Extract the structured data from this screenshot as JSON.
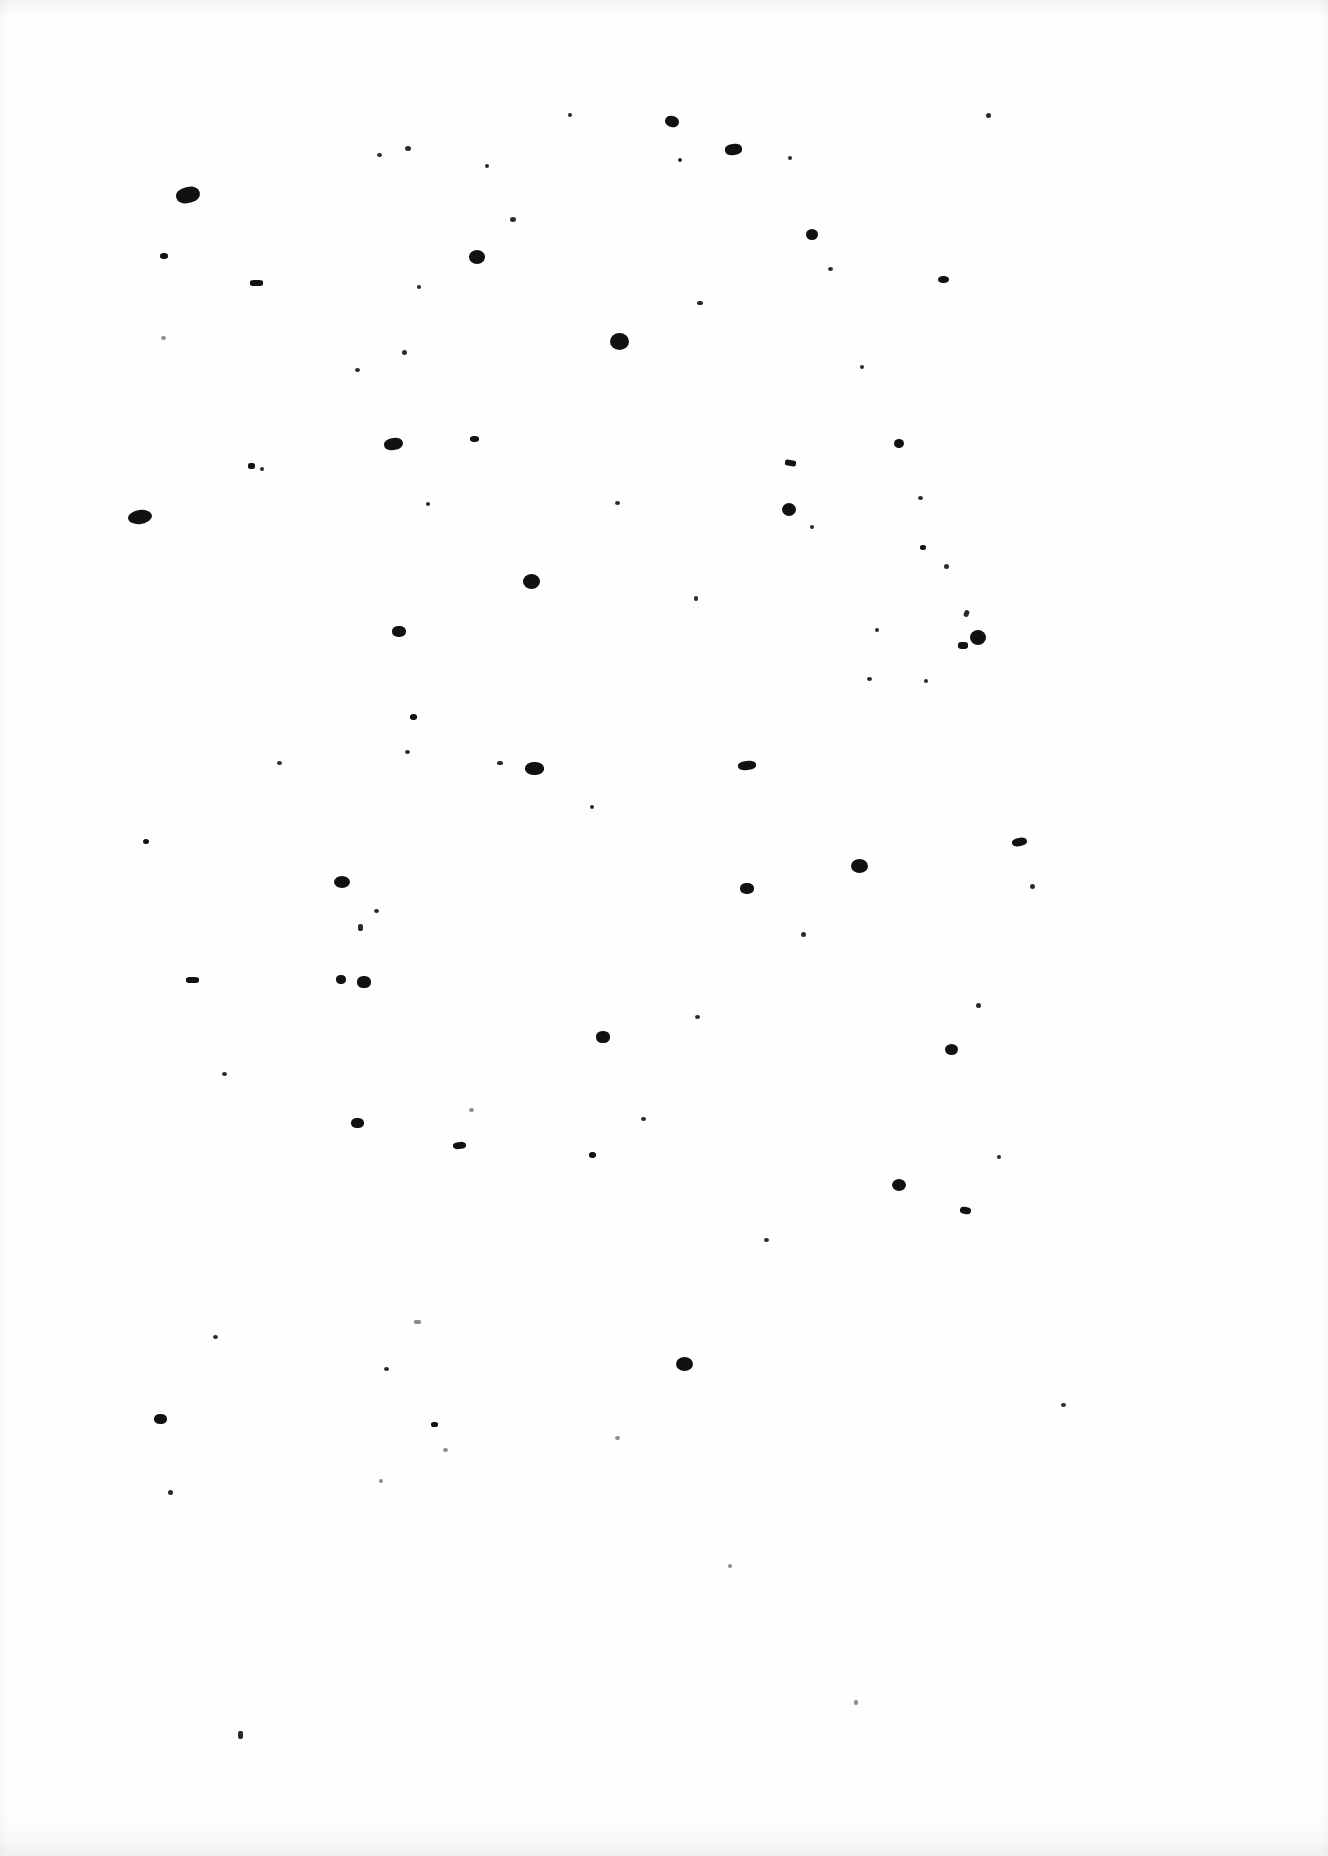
{
  "document": {
    "kind": "scanned-page",
    "title": "Scanned Blank Page",
    "page_width": 1328,
    "page_height": 1856,
    "background_color": "#fefefe",
    "ink_color": "#141414",
    "visible_text": "",
    "has_text": false,
    "description": "Blank scanned sheet of paper bearing only scattered ink specks, dust marks and show-through flecks."
  },
  "scan_artifacts": {
    "edge_shadow_color": "#96969b",
    "top_edge": true,
    "bottom_edge": true,
    "left_edge": true,
    "right_edge": true
  },
  "marks": [
    {
      "x": 988,
      "y": 115,
      "w": 5,
      "h": 5,
      "r": 50,
      "rot": 0,
      "cls": "tiny"
    },
    {
      "x": 672,
      "y": 121,
      "w": 14,
      "h": 11,
      "r": 45,
      "rot": 15,
      "cls": "blob"
    },
    {
      "x": 570,
      "y": 115,
      "w": 4,
      "h": 4,
      "r": 50,
      "rot": 0,
      "cls": "tiny"
    },
    {
      "x": 733,
      "y": 149,
      "w": 17,
      "h": 11,
      "r": 40,
      "rot": -8,
      "cls": "blob"
    },
    {
      "x": 408,
      "y": 148,
      "w": 6,
      "h": 5,
      "r": 50,
      "rot": 0,
      "cls": "tiny"
    },
    {
      "x": 379,
      "y": 155,
      "w": 5,
      "h": 4,
      "r": 50,
      "rot": 0,
      "cls": "tiny"
    },
    {
      "x": 487,
      "y": 166,
      "w": 4,
      "h": 4,
      "r": 50,
      "rot": 0,
      "cls": "tiny"
    },
    {
      "x": 680,
      "y": 160,
      "w": 4,
      "h": 4,
      "r": 50,
      "rot": 0,
      "cls": "tiny"
    },
    {
      "x": 790,
      "y": 158,
      "w": 4,
      "h": 4,
      "r": 50,
      "rot": 0,
      "cls": "tiny"
    },
    {
      "x": 188,
      "y": 195,
      "w": 24,
      "h": 16,
      "r": 45,
      "rot": -12,
      "cls": "blob"
    },
    {
      "x": 513,
      "y": 219,
      "w": 6,
      "h": 5,
      "r": 50,
      "rot": 0,
      "cls": "tiny"
    },
    {
      "x": 812,
      "y": 234,
      "w": 12,
      "h": 11,
      "r": 50,
      "rot": 0,
      "cls": "blob"
    },
    {
      "x": 477,
      "y": 257,
      "w": 16,
      "h": 14,
      "r": 50,
      "rot": 0,
      "cls": "blob"
    },
    {
      "x": 164,
      "y": 256,
      "w": 8,
      "h": 6,
      "r": 45,
      "rot": 0,
      "cls": "blob"
    },
    {
      "x": 830,
      "y": 269,
      "w": 5,
      "h": 4,
      "r": 50,
      "rot": 0,
      "cls": "tiny"
    },
    {
      "x": 943,
      "y": 279,
      "w": 11,
      "h": 7,
      "r": 45,
      "rot": 0,
      "cls": "blob"
    },
    {
      "x": 256,
      "y": 283,
      "w": 13,
      "h": 6,
      "r": 30,
      "rot": 0,
      "cls": "blob"
    },
    {
      "x": 419,
      "y": 287,
      "w": 4,
      "h": 4,
      "r": 50,
      "rot": 0,
      "cls": "tiny"
    },
    {
      "x": 700,
      "y": 303,
      "w": 6,
      "h": 4,
      "r": 40,
      "rot": 0,
      "cls": "tiny"
    },
    {
      "x": 619,
      "y": 341,
      "w": 19,
      "h": 17,
      "r": 50,
      "rot": 0,
      "cls": "blob"
    },
    {
      "x": 163,
      "y": 338,
      "w": 5,
      "h": 4,
      "r": 50,
      "rot": 0,
      "cls": "faint"
    },
    {
      "x": 404,
      "y": 352,
      "w": 5,
      "h": 5,
      "r": 50,
      "rot": 0,
      "cls": "tiny"
    },
    {
      "x": 357,
      "y": 370,
      "w": 5,
      "h": 4,
      "r": 50,
      "rot": 0,
      "cls": "tiny"
    },
    {
      "x": 862,
      "y": 367,
      "w": 4,
      "h": 4,
      "r": 50,
      "rot": 0,
      "cls": "tiny"
    },
    {
      "x": 393,
      "y": 444,
      "w": 19,
      "h": 12,
      "r": 45,
      "rot": -10,
      "cls": "blob"
    },
    {
      "x": 474,
      "y": 439,
      "w": 9,
      "h": 6,
      "r": 45,
      "rot": 0,
      "cls": "blob"
    },
    {
      "x": 899,
      "y": 443,
      "w": 10,
      "h": 9,
      "r": 50,
      "rot": 0,
      "cls": "blob"
    },
    {
      "x": 790,
      "y": 463,
      "w": 11,
      "h": 6,
      "r": 30,
      "rot": 10,
      "cls": "blob"
    },
    {
      "x": 251,
      "y": 466,
      "w": 7,
      "h": 6,
      "r": 35,
      "rot": 0,
      "cls": "blob"
    },
    {
      "x": 262,
      "y": 469,
      "w": 4,
      "h": 4,
      "r": 50,
      "rot": 0,
      "cls": "tiny"
    },
    {
      "x": 428,
      "y": 504,
      "w": 4,
      "h": 4,
      "r": 50,
      "rot": 0,
      "cls": "tiny"
    },
    {
      "x": 140,
      "y": 517,
      "w": 24,
      "h": 14,
      "r": 50,
      "rot": -8,
      "cls": "blob"
    },
    {
      "x": 789,
      "y": 509,
      "w": 14,
      "h": 13,
      "r": 50,
      "rot": 0,
      "cls": "blob"
    },
    {
      "x": 617,
      "y": 503,
      "w": 5,
      "h": 4,
      "r": 50,
      "rot": 0,
      "cls": "tiny"
    },
    {
      "x": 920,
      "y": 498,
      "w": 5,
      "h": 4,
      "r": 50,
      "rot": 0,
      "cls": "tiny"
    },
    {
      "x": 812,
      "y": 527,
      "w": 4,
      "h": 4,
      "r": 50,
      "rot": 0,
      "cls": "tiny"
    },
    {
      "x": 923,
      "y": 547,
      "w": 6,
      "h": 5,
      "r": 45,
      "rot": 0,
      "cls": "blob"
    },
    {
      "x": 946,
      "y": 566,
      "w": 5,
      "h": 5,
      "r": 50,
      "rot": 0,
      "cls": "tiny"
    },
    {
      "x": 531,
      "y": 581,
      "w": 17,
      "h": 15,
      "r": 50,
      "rot": 0,
      "cls": "blob"
    },
    {
      "x": 696,
      "y": 598,
      "w": 4,
      "h": 5,
      "r": 45,
      "rot": 0,
      "cls": "tiny"
    },
    {
      "x": 966,
      "y": 613,
      "w": 5,
      "h": 7,
      "r": 40,
      "rot": 20,
      "cls": "tiny"
    },
    {
      "x": 399,
      "y": 631,
      "w": 14,
      "h": 11,
      "r": 45,
      "rot": 0,
      "cls": "blob"
    },
    {
      "x": 877,
      "y": 630,
      "w": 4,
      "h": 4,
      "r": 50,
      "rot": 0,
      "cls": "tiny"
    },
    {
      "x": 978,
      "y": 637,
      "w": 16,
      "h": 15,
      "r": 50,
      "rot": 0,
      "cls": "blob"
    },
    {
      "x": 963,
      "y": 645,
      "w": 10,
      "h": 7,
      "r": 35,
      "rot": 0,
      "cls": "blob"
    },
    {
      "x": 869,
      "y": 679,
      "w": 5,
      "h": 4,
      "r": 50,
      "rot": 0,
      "cls": "tiny"
    },
    {
      "x": 926,
      "y": 681,
      "w": 4,
      "h": 4,
      "r": 50,
      "rot": 0,
      "cls": "tiny"
    },
    {
      "x": 413,
      "y": 717,
      "w": 7,
      "h": 6,
      "r": 45,
      "rot": 0,
      "cls": "blob"
    },
    {
      "x": 407,
      "y": 752,
      "w": 5,
      "h": 4,
      "r": 50,
      "rot": 0,
      "cls": "tiny"
    },
    {
      "x": 279,
      "y": 763,
      "w": 5,
      "h": 4,
      "r": 50,
      "rot": 0,
      "cls": "tiny"
    },
    {
      "x": 500,
      "y": 763,
      "w": 6,
      "h": 4,
      "r": 40,
      "rot": 0,
      "cls": "tiny"
    },
    {
      "x": 534,
      "y": 768,
      "w": 19,
      "h": 13,
      "r": 45,
      "rot": 0,
      "cls": "blob"
    },
    {
      "x": 747,
      "y": 765,
      "w": 18,
      "h": 9,
      "r": 40,
      "rot": -5,
      "cls": "blob"
    },
    {
      "x": 592,
      "y": 807,
      "w": 4,
      "h": 4,
      "r": 50,
      "rot": 0,
      "cls": "tiny"
    },
    {
      "x": 1019,
      "y": 842,
      "w": 15,
      "h": 8,
      "r": 40,
      "rot": -10,
      "cls": "blob"
    },
    {
      "x": 146,
      "y": 841,
      "w": 6,
      "h": 5,
      "r": 50,
      "rot": 0,
      "cls": "blob"
    },
    {
      "x": 859,
      "y": 866,
      "w": 17,
      "h": 14,
      "r": 50,
      "rot": 0,
      "cls": "blob"
    },
    {
      "x": 1032,
      "y": 886,
      "w": 5,
      "h": 5,
      "r": 50,
      "rot": 0,
      "cls": "tiny"
    },
    {
      "x": 342,
      "y": 882,
      "w": 16,
      "h": 12,
      "r": 50,
      "rot": 0,
      "cls": "blob"
    },
    {
      "x": 747,
      "y": 888,
      "w": 14,
      "h": 11,
      "r": 45,
      "rot": 0,
      "cls": "blob"
    },
    {
      "x": 376,
      "y": 911,
      "w": 5,
      "h": 4,
      "r": 50,
      "rot": 0,
      "cls": "tiny"
    },
    {
      "x": 360,
      "y": 927,
      "w": 5,
      "h": 7,
      "r": 40,
      "rot": 0,
      "cls": "tiny"
    },
    {
      "x": 803,
      "y": 934,
      "w": 5,
      "h": 5,
      "r": 50,
      "rot": 0,
      "cls": "tiny"
    },
    {
      "x": 192,
      "y": 980,
      "w": 13,
      "h": 6,
      "r": 35,
      "rot": 0,
      "cls": "blob"
    },
    {
      "x": 341,
      "y": 979,
      "w": 10,
      "h": 9,
      "r": 45,
      "rot": 0,
      "cls": "blob"
    },
    {
      "x": 364,
      "y": 982,
      "w": 14,
      "h": 12,
      "r": 45,
      "rot": 0,
      "cls": "blob"
    },
    {
      "x": 978,
      "y": 1005,
      "w": 5,
      "h": 5,
      "r": 50,
      "rot": 0,
      "cls": "tiny"
    },
    {
      "x": 697,
      "y": 1017,
      "w": 5,
      "h": 4,
      "r": 50,
      "rot": 0,
      "cls": "tiny"
    },
    {
      "x": 603,
      "y": 1037,
      "w": 14,
      "h": 12,
      "r": 45,
      "rot": 0,
      "cls": "blob"
    },
    {
      "x": 951,
      "y": 1049,
      "w": 13,
      "h": 11,
      "r": 50,
      "rot": 0,
      "cls": "blob"
    },
    {
      "x": 224,
      "y": 1074,
      "w": 5,
      "h": 4,
      "r": 50,
      "rot": 0,
      "cls": "tiny"
    },
    {
      "x": 471,
      "y": 1110,
      "w": 5,
      "h": 4,
      "r": 50,
      "rot": 0,
      "cls": "faint"
    },
    {
      "x": 643,
      "y": 1119,
      "w": 5,
      "h": 4,
      "r": 50,
      "rot": 0,
      "cls": "tiny"
    },
    {
      "x": 357,
      "y": 1123,
      "w": 13,
      "h": 10,
      "r": 45,
      "rot": 0,
      "cls": "blob"
    },
    {
      "x": 459,
      "y": 1145,
      "w": 13,
      "h": 7,
      "r": 40,
      "rot": -5,
      "cls": "blob"
    },
    {
      "x": 592,
      "y": 1155,
      "w": 7,
      "h": 6,
      "r": 45,
      "rot": 0,
      "cls": "blob"
    },
    {
      "x": 999,
      "y": 1157,
      "w": 4,
      "h": 4,
      "r": 50,
      "rot": 0,
      "cls": "tiny"
    },
    {
      "x": 899,
      "y": 1185,
      "w": 14,
      "h": 12,
      "r": 50,
      "rot": 0,
      "cls": "blob"
    },
    {
      "x": 965,
      "y": 1210,
      "w": 11,
      "h": 7,
      "r": 40,
      "rot": 10,
      "cls": "blob"
    },
    {
      "x": 766,
      "y": 1240,
      "w": 5,
      "h": 4,
      "r": 50,
      "rot": 0,
      "cls": "tiny"
    },
    {
      "x": 417,
      "y": 1322,
      "w": 7,
      "h": 4,
      "r": 30,
      "rot": 0,
      "cls": "faint"
    },
    {
      "x": 215,
      "y": 1337,
      "w": 5,
      "h": 4,
      "r": 50,
      "rot": 0,
      "cls": "tiny"
    },
    {
      "x": 684,
      "y": 1364,
      "w": 17,
      "h": 14,
      "r": 50,
      "rot": 0,
      "cls": "blob"
    },
    {
      "x": 386,
      "y": 1369,
      "w": 5,
      "h": 4,
      "r": 50,
      "rot": 0,
      "cls": "tiny"
    },
    {
      "x": 1063,
      "y": 1405,
      "w": 5,
      "h": 4,
      "r": 50,
      "rot": 0,
      "cls": "tiny"
    },
    {
      "x": 160,
      "y": 1419,
      "w": 13,
      "h": 10,
      "r": 45,
      "rot": 0,
      "cls": "blob"
    },
    {
      "x": 434,
      "y": 1424,
      "w": 7,
      "h": 5,
      "r": 40,
      "rot": 0,
      "cls": "blob"
    },
    {
      "x": 617,
      "y": 1438,
      "w": 5,
      "h": 4,
      "r": 50,
      "rot": 0,
      "cls": "faint"
    },
    {
      "x": 445,
      "y": 1450,
      "w": 5,
      "h": 4,
      "r": 50,
      "rot": 0,
      "cls": "faint"
    },
    {
      "x": 170,
      "y": 1492,
      "w": 5,
      "h": 5,
      "r": 50,
      "rot": 0,
      "cls": "tiny"
    },
    {
      "x": 381,
      "y": 1481,
      "w": 4,
      "h": 4,
      "r": 50,
      "rot": 0,
      "cls": "faint"
    },
    {
      "x": 730,
      "y": 1566,
      "w": 4,
      "h": 4,
      "r": 50,
      "rot": 0,
      "cls": "faint"
    },
    {
      "x": 240,
      "y": 1735,
      "w": 5,
      "h": 8,
      "r": 30,
      "rot": 0,
      "cls": "tiny"
    },
    {
      "x": 856,
      "y": 1702,
      "w": 4,
      "h": 5,
      "r": 40,
      "rot": 0,
      "cls": "faint"
    }
  ]
}
